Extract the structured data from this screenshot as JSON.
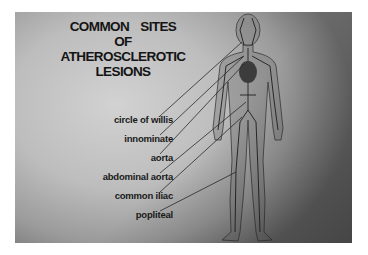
{
  "diagram": {
    "title_lines": [
      "COMMON SITES",
      "OF",
      "ATHEROSCLEROTIC",
      "LESIONS"
    ],
    "labels": [
      {
        "text": "circle of willis",
        "target": "head"
      },
      {
        "text": "innominate",
        "target": "upper-chest"
      },
      {
        "text": "aorta",
        "target": "heart"
      },
      {
        "text": "abdominal aorta",
        "target": "abdomen"
      },
      {
        "text": "common iliac",
        "target": "pelvis"
      },
      {
        "text": "popliteal",
        "target": "knee"
      }
    ],
    "figure": "human-body-circulatory-system"
  }
}
